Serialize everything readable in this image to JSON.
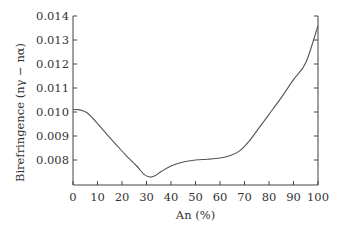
{
  "chart_data": {
    "type": "line",
    "title": "",
    "xlabel": "An (%)",
    "ylabel": "Birefringence (nγ − nα)",
    "xlim": [
      0,
      100
    ],
    "ylim": [
      0.00707,
      0.014
    ],
    "x_ticks": [
      0,
      10,
      20,
      30,
      40,
      50,
      60,
      70,
      80,
      90,
      100
    ],
    "x_tick_labels": [
      "0",
      "10",
      "20",
      "30",
      "40",
      "50",
      "60",
      "70",
      "80",
      "90",
      "100"
    ],
    "y_ticks": [
      0.008,
      0.009,
      0.01,
      0.011,
      0.012,
      0.013,
      0.014
    ],
    "y_tick_labels": [
      "0.008",
      "0.009",
      "0.010",
      "0.011",
      "0.012",
      "0.013",
      "0.014"
    ],
    "grid": false,
    "legend": null,
    "right_axis_ticks_unlabeled": true,
    "series": [
      {
        "name": "Birefringence",
        "color": "#555555",
        "x": [
          0,
          2,
          4,
          6,
          8,
          10,
          14,
          18,
          22,
          26,
          29,
          31,
          33,
          36,
          40,
          45,
          50,
          55,
          60,
          64,
          68,
          72,
          76,
          80,
          85,
          90,
          95,
          100
        ],
        "y": [
          0.0101,
          0.0101,
          0.01005,
          0.00995,
          0.00975,
          0.00952,
          0.00905,
          0.0086,
          0.00815,
          0.00775,
          0.0074,
          0.0073,
          0.00732,
          0.00752,
          0.00775,
          0.00792,
          0.008,
          0.00803,
          0.00808,
          0.00818,
          0.00838,
          0.0088,
          0.00935,
          0.0099,
          0.0106,
          0.01135,
          0.01205,
          0.0136
        ]
      }
    ]
  }
}
